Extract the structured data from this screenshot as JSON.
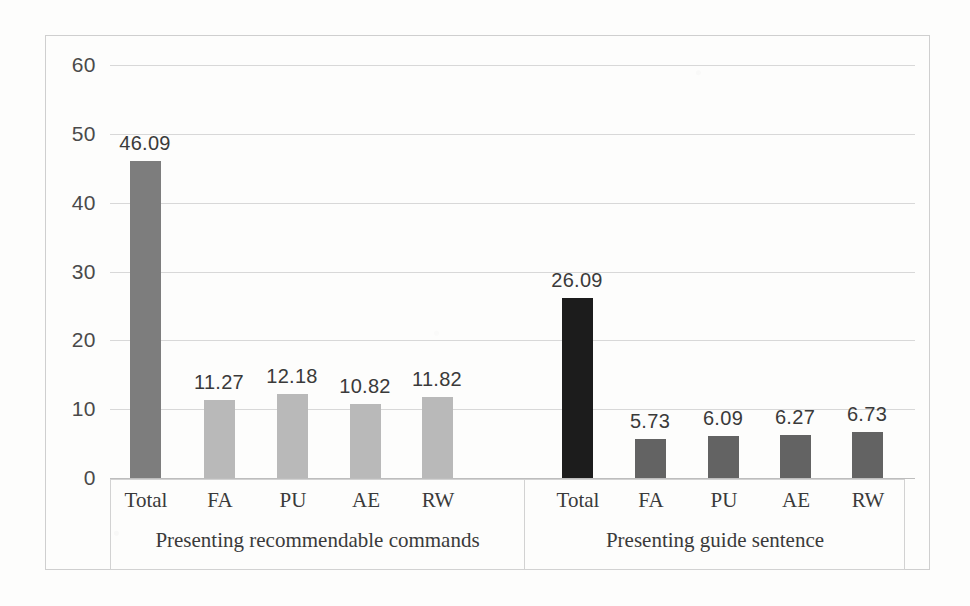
{
  "chart_data": {
    "type": "bar",
    "title": "",
    "xlabel": "",
    "ylabel": "",
    "ylim": [
      0,
      60
    ],
    "ytick_labels": [
      "60",
      "50",
      "40",
      "30",
      "20",
      "10",
      "0"
    ],
    "yticks": [
      60,
      50,
      40,
      30,
      20,
      10,
      0
    ],
    "grid": true,
    "legend": "none",
    "categories": [
      "Total",
      "FA",
      "PU",
      "AE",
      "RW"
    ],
    "groups": [
      {
        "name": "Presenting recommendable commands",
        "values": [
          46.09,
          11.27,
          12.18,
          10.82,
          11.82
        ],
        "labels": [
          "46.09",
          "11.27",
          "12.18",
          "10.82",
          "11.82"
        ],
        "bar_colors": [
          "#7d7d7d",
          "#b9b9b9",
          "#b9b9b9",
          "#b9b9b9",
          "#b9b9b9"
        ]
      },
      {
        "name": "Presenting guide sentence",
        "values": [
          26.09,
          5.73,
          6.09,
          6.27,
          6.73
        ],
        "labels": [
          "26.09",
          "5.73",
          "6.09",
          "6.27",
          "6.73"
        ],
        "bar_colors": [
          "#1c1c1c",
          "#636363",
          "#636363",
          "#636363",
          "#636363"
        ]
      }
    ]
  },
  "axis": {
    "y_labels": [
      "60",
      "50",
      "40",
      "30",
      "20",
      "10",
      "0"
    ]
  },
  "categories": {
    "g1": [
      "Total",
      "FA",
      "PU",
      "AE",
      "RW"
    ],
    "g2": [
      "Total",
      "FA",
      "PU",
      "AE",
      "RW"
    ]
  },
  "group_titles": {
    "first": "Presenting recommendable commands",
    "second": "Presenting guide sentence"
  },
  "values": {
    "g1": [
      "46.09",
      "11.27",
      "12.18",
      "10.82",
      "11.82"
    ],
    "g2": [
      "26.09",
      "5.73",
      "6.09",
      "6.27",
      "6.73"
    ]
  },
  "colors": {
    "grid": "#d8d8d8",
    "frame": "#cfcfcf",
    "text": "#3a3a3a",
    "g1_total": "#7d7d7d",
    "g1_other": "#b9b9b9",
    "g2_total": "#1c1c1c",
    "g2_other": "#636363"
  }
}
